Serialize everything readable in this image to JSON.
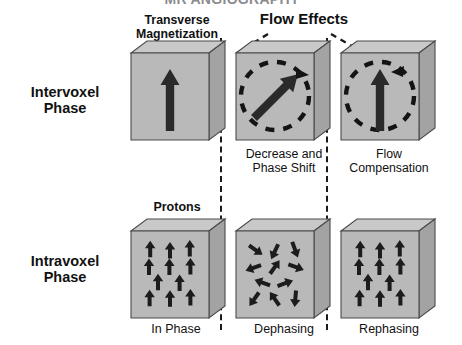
{
  "figure": {
    "title_cut_off": "MR ANGIOGRAPHY",
    "row_labels": [
      {
        "key": "intervoxel",
        "line1": "Intervoxel",
        "line2": "Phase"
      },
      {
        "key": "intravoxel",
        "line1": "Intravoxel",
        "line2": "Phase"
      }
    ],
    "column_headers": [
      {
        "key": "transverse",
        "line1": "Transverse",
        "line2": "Magnetization"
      },
      {
        "key": "flow_effects",
        "line1": "Flow Effects",
        "line2": ""
      },
      {
        "key": "protons",
        "line1": "Protons",
        "line2": ""
      }
    ],
    "captions": {
      "top_middle_line1": "Decrease and",
      "top_middle_line2": "Phase Shift",
      "top_right_line1": "Flow",
      "top_right_line2": "Compensation",
      "bottom_left": "In Phase",
      "bottom_middle": "Dephasing",
      "bottom_right": "Rephasing"
    },
    "colors": {
      "cube_front": "#b9b9b9",
      "cube_top": "#c9c9c9",
      "cube_side": "#a6a6a6",
      "cube_stroke": "#4a4a4a",
      "arrow": "#2a2a2a",
      "dash": "#1a1a1a",
      "text": "#111111",
      "background": "#ffffff"
    },
    "cells": [
      {
        "key": "intervoxel-transverse",
        "row": "intervoxel",
        "column": "transverse",
        "vector_angle_deg": 90,
        "has_dashed_circle": false,
        "caption": ""
      },
      {
        "key": "intervoxel-decrease-phase-shift",
        "row": "intervoxel",
        "column": "flow_effects",
        "vector_angle_deg": 45,
        "has_dashed_circle": true,
        "caption": "Decrease and Phase Shift"
      },
      {
        "key": "intervoxel-flow-compensation",
        "row": "intervoxel",
        "column": "flow_effects",
        "vector_angle_deg": 90,
        "has_dashed_circle": true,
        "caption": "Flow Compensation"
      },
      {
        "key": "intravoxel-in-phase",
        "row": "intravoxel",
        "column": "protons",
        "proton_count": 11,
        "proton_angles_deg": [
          0,
          0,
          0,
          0,
          0,
          0,
          0,
          0,
          0,
          0,
          0
        ],
        "caption": "In Phase"
      },
      {
        "key": "intravoxel-dephasing",
        "row": "intravoxel",
        "column": "flow_effects",
        "proton_count": 11,
        "proton_angles_deg": [
          125,
          205,
          160,
          250,
          35,
          110,
          290,
          70,
          215,
          325,
          185
        ],
        "caption": "Dephasing"
      },
      {
        "key": "intravoxel-rephasing",
        "row": "intravoxel",
        "column": "flow_effects",
        "proton_count": 11,
        "proton_angles_deg": [
          0,
          0,
          0,
          0,
          0,
          0,
          0,
          0,
          0,
          0,
          0
        ],
        "caption": "Rephasing"
      }
    ],
    "proton_layout": [
      {
        "x": 0.17,
        "y": 0.14
      },
      {
        "x": 0.5,
        "y": 0.16
      },
      {
        "x": 0.83,
        "y": 0.13
      },
      {
        "x": 0.15,
        "y": 0.4
      },
      {
        "x": 0.49,
        "y": 0.4
      },
      {
        "x": 0.84,
        "y": 0.39
      },
      {
        "x": 0.3,
        "y": 0.62
      },
      {
        "x": 0.66,
        "y": 0.63
      },
      {
        "x": 0.16,
        "y": 0.85
      },
      {
        "x": 0.5,
        "y": 0.86
      },
      {
        "x": 0.84,
        "y": 0.84
      }
    ],
    "bracket": {
      "name": "flow-effects-bracket",
      "left_leg": [
        [
          268,
          36
        ],
        [
          238,
          52
        ]
      ],
      "right_leg": [
        [
          330,
          36
        ],
        [
          368,
          55
        ]
      ]
    }
  }
}
